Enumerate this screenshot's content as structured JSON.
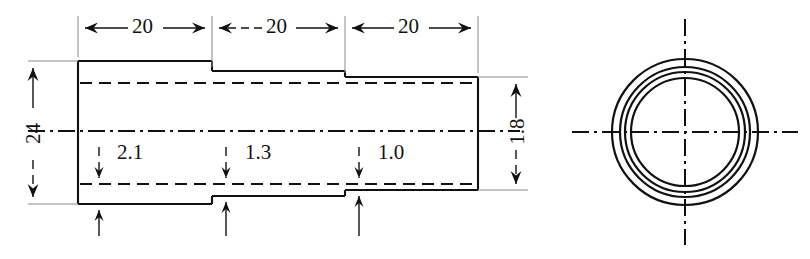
{
  "drawing": {
    "title": "Stepped tubular section with cross-sectional end view",
    "units_note": "",
    "line_color": "#111111",
    "background": "#ffffff",
    "views": {
      "section_view": {
        "name": "longitudinal-section-view",
        "length_dimensions": [
          {
            "label": "20",
            "segment": "left",
            "x_from": 77,
            "x_to": 212
          },
          {
            "label": "20",
            "segment": "middle",
            "x_from": 212,
            "x_to": 345
          },
          {
            "label": "20",
            "segment": "right",
            "x_from": 345,
            "x_to": 478
          }
        ],
        "height_dimension": {
          "label": "24",
          "orientation": "vertical",
          "rotated": true
        },
        "bore_dimension": {
          "label": "1.8",
          "orientation": "vertical",
          "rotated": true
        },
        "wall_thickness_labels": [
          {
            "label": "2.1",
            "segment": "left"
          },
          {
            "label": "1.3",
            "segment": "middle"
          },
          {
            "label": "1.0",
            "segment": "right"
          }
        ]
      },
      "end_view": {
        "name": "circular-end-view",
        "center": {
          "x": 685,
          "y": 132
        },
        "circle_radii": [
          73,
          65,
          60,
          54
        ],
        "centerlines": [
          "horizontal",
          "vertical"
        ]
      }
    }
  }
}
